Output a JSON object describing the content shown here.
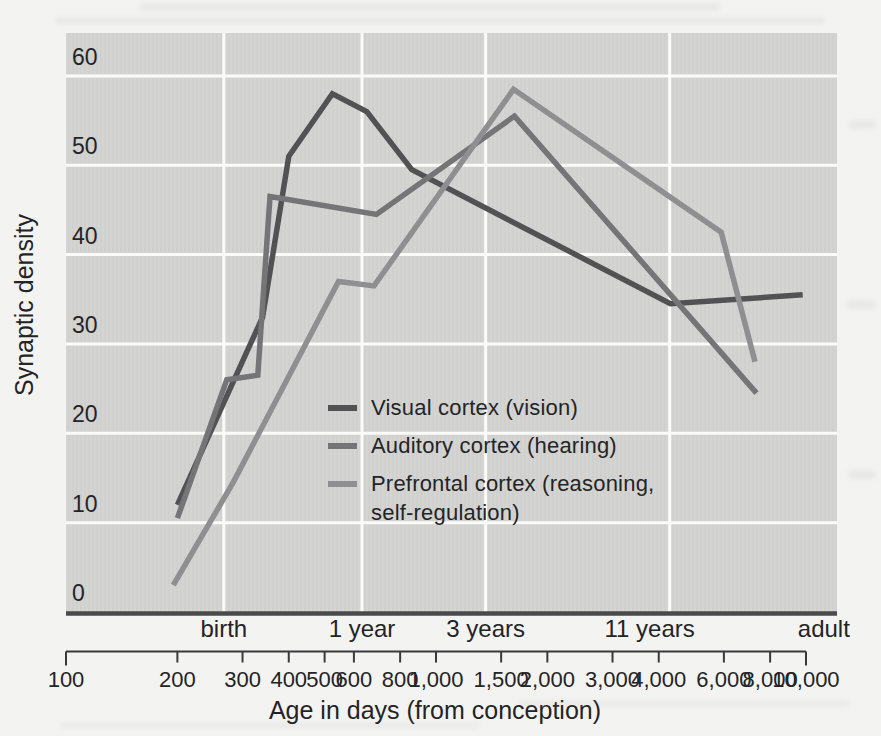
{
  "chart_data": {
    "type": "line",
    "title": "",
    "ylabel": "Synaptic density",
    "xlabel": "Age in days (from conception)",
    "x_scale": "log10",
    "x_domain_days": [
      100,
      12130
    ],
    "ylim": [
      0,
      64.8
    ],
    "grid": true,
    "legend_position": "inside-lower-middle",
    "y_ticks": [
      {
        "value": 0,
        "label": "0"
      },
      {
        "value": 10,
        "label": "10"
      },
      {
        "value": 20,
        "label": "20"
      },
      {
        "value": 30,
        "label": "30"
      },
      {
        "value": 40,
        "label": "40"
      },
      {
        "value": 50,
        "label": "50"
      },
      {
        "value": 60,
        "label": "60"
      }
    ],
    "y_gridline_values": [
      10,
      20,
      30,
      40,
      50,
      60
    ],
    "x_day_ticks": [
      {
        "days": 100,
        "label": "100"
      },
      {
        "days": 200,
        "label": "200"
      },
      {
        "days": 300,
        "label": "300"
      },
      {
        "days": 400,
        "label": "400"
      },
      {
        "days": 500,
        "label": "500"
      },
      {
        "days": 600,
        "label": "600"
      },
      {
        "days": 800,
        "label": "800"
      },
      {
        "days": 1000,
        "label": "1,000"
      },
      {
        "days": 1500,
        "label": "1,500"
      },
      {
        "days": 2000,
        "label": "2,000"
      },
      {
        "days": 3000,
        "label": "3,000"
      },
      {
        "days": 4000,
        "label": "4,000"
      },
      {
        "days": 6000,
        "label": "6,000"
      },
      {
        "days": 8000,
        "label": "8,000"
      },
      {
        "days": 10000,
        "label": "10,000"
      }
    ],
    "age_marks": [
      {
        "days": 267,
        "label": "birth",
        "gridline": true
      },
      {
        "days": 631,
        "label": "1 year",
        "gridline": true
      },
      {
        "days": 1362,
        "label": "3 years",
        "gridline": true
      },
      {
        "days": 4281,
        "label": "11 years",
        "gridline": true
      },
      {
        "days": 11600,
        "label": "adult",
        "gridline": false
      }
    ],
    "series": [
      {
        "name": "Visual cortex (vision)",
        "slug": "visual-cortex",
        "color": "#525254",
        "points": [
          [
            200,
            12
          ],
          [
            340,
            33
          ],
          [
            400,
            51
          ],
          [
            525,
            58
          ],
          [
            650,
            56
          ],
          [
            860,
            49.5
          ],
          [
            4300,
            34.5
          ],
          [
            9800,
            35.5
          ]
        ]
      },
      {
        "name": "Auditory cortex (hearing)",
        "slug": "auditory-cortex",
        "color": "#757578",
        "points": [
          [
            200,
            10.5
          ],
          [
            272,
            26
          ],
          [
            330,
            26.5
          ],
          [
            356,
            46.5
          ],
          [
            690,
            44.5
          ],
          [
            1630,
            55.5
          ],
          [
            7350,
            24.5
          ]
        ]
      },
      {
        "name": "Prefrontal cortex (reasoning, self-regulation)",
        "slug": "prefrontal-cortex",
        "color": "#8f8f92",
        "points": [
          [
            195,
            3
          ],
          [
            283,
            14.5
          ],
          [
            545,
            37
          ],
          [
            680,
            36.5
          ],
          [
            1620,
            58.5
          ],
          [
            5900,
            42.5
          ],
          [
            7280,
            28
          ]
        ]
      }
    ]
  },
  "legend": {
    "items": [
      {
        "label": "Visual cortex (vision)"
      },
      {
        "label": "Auditory cortex (hearing)"
      },
      {
        "label": "Prefrontal cortex (reasoning, self-regulation)"
      }
    ]
  },
  "colors": {
    "page_bg": "#f3f3f1",
    "plot_bg": "#d4d4d3",
    "gridline": "#fbfbfa",
    "axis_line": "#4a4a4c",
    "ruler": "#3a3a3c",
    "text": "#242426"
  }
}
